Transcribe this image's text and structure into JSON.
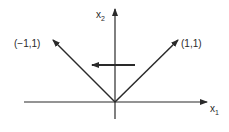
{
  "diagram": {
    "type": "vector-diagram",
    "colors": {
      "stroke": "#2a2a2a",
      "background": "#ffffff"
    },
    "axes": {
      "x": {
        "label": "x",
        "subscript": "1"
      },
      "y": {
        "label": "x",
        "subscript": "2"
      }
    },
    "vectors": [
      {
        "label": "(−1,1)",
        "direction": [
          -1,
          1
        ]
      },
      {
        "label": "(1,1)",
        "direction": [
          1,
          1
        ]
      }
    ],
    "arrow_annotation": {
      "direction": "left"
    }
  }
}
